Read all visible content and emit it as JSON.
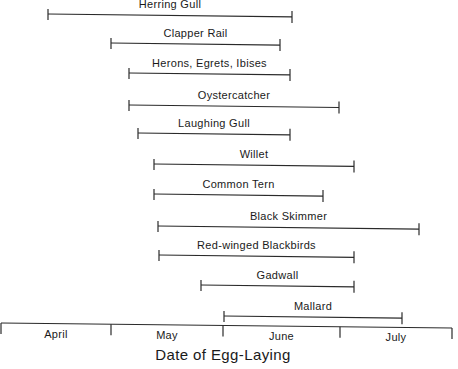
{
  "chart_data": {
    "type": "range-bar",
    "title": "",
    "xlabel": "Date of Egg-Laying",
    "ylabel": "",
    "months": [
      "April",
      "May",
      "June",
      "July"
    ],
    "axis": {
      "month_tick_px": [
        1,
        111,
        223,
        340,
        452
      ],
      "axis_y_left": 323,
      "axis_y_right": 328,
      "grid": false,
      "legend": "none"
    },
    "series": [
      {
        "name": "Herring Gull",
        "start": "Apr 14",
        "end": "Jun 21",
        "x0": 48,
        "x1": 292,
        "y": 14
      },
      {
        "name": "Clapper Rail",
        "start": "May 1",
        "end": "Jun 17",
        "x0": 111,
        "x1": 280,
        "y": 43
      },
      {
        "name": "Herons, Egrets, Ibises",
        "start": "May 6",
        "end": "Jun 20",
        "x0": 129,
        "x1": 290,
        "y": 73
      },
      {
        "name": "Oystercatcher",
        "start": "May 6",
        "end": "Jul 1",
        "x0": 129,
        "x1": 339,
        "y": 105
      },
      {
        "name": "Laughing Gull",
        "start": "May 8",
        "end": "Jun 20",
        "x0": 138,
        "x1": 290,
        "y": 133
      },
      {
        "name": "Willet",
        "start": "May 8",
        "end": "Jul 5",
        "x0": 154,
        "x1": 354,
        "y": 164
      },
      {
        "name": "Common Tern",
        "start": "May 8",
        "end": "Jun 26",
        "x0": 154,
        "x1": 323,
        "y": 194
      },
      {
        "name": "Black Skimmer",
        "start": "May 13",
        "end": "Jul 23",
        "x0": 158,
        "x1": 419,
        "y": 226
      },
      {
        "name": "Red-winged Blackbirds",
        "start": "May 13",
        "end": "Jul 5",
        "x0": 159,
        "x1": 354,
        "y": 255
      },
      {
        "name": "Gadwall",
        "start": "May 24",
        "end": "Jul 5",
        "x0": 201,
        "x1": 354,
        "y": 285
      },
      {
        "name": "Mallard",
        "start": "Jun 1",
        "end": "Jul 17",
        "x0": 224,
        "x1": 402,
        "y": 316
      }
    ]
  }
}
